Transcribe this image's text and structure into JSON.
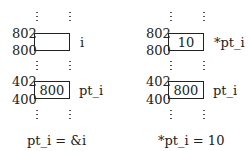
{
  "panels": [
    {
      "top_cell": {
        "addr_high": "802",
        "addr_low": "800",
        "value": "",
        "label": "i"
      },
      "bottom_cell": {
        "addr_high": "402",
        "addr_low": "400",
        "value": "800",
        "label": "pt_i"
      },
      "caption": "pt_i = &i"
    },
    {
      "top_cell": {
        "addr_high": "802",
        "addr_low": "800",
        "value": "10",
        "label": "*pt_i"
      },
      "bottom_cell": {
        "addr_high": "402",
        "addr_low": "400",
        "value": "800",
        "label": "pt_i"
      },
      "caption": "*pt_i = 10"
    }
  ]
}
